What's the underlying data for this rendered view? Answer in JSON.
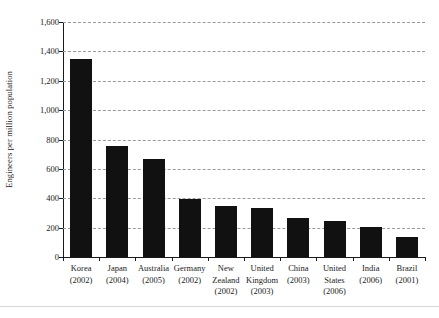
{
  "chart_data": {
    "type": "bar",
    "title": "",
    "xlabel": "",
    "ylabel": "Engineers per million population",
    "ylim": [
      0,
      1600
    ],
    "ytick_values": [
      1600,
      1400,
      1200,
      1000,
      800,
      600,
      400,
      200,
      0
    ],
    "ytick_labels": [
      "1,600",
      "1,400",
      "1,200",
      "1,000",
      "800",
      "600",
      "400",
      "200",
      "0"
    ],
    "grid": true,
    "grid_style": "dashed-horizontal",
    "legend": "none",
    "bar_color": "#111111",
    "categories": [
      "Korea (2002)",
      "Japan (2004)",
      "Australia (2005)",
      "Germany (2002)",
      "New Zealand (2002)",
      "United Kingdom (2003)",
      "China (2003)",
      "United States (2006)",
      "India (2006)",
      "Brazil (2001)"
    ],
    "category_names": [
      "Korea",
      "Japan",
      "Australia",
      "Germany",
      "New Zealand",
      "United Kingdom",
      "China",
      "United States",
      "India",
      "Brazil"
    ],
    "category_years": [
      "(2002)",
      "(2004)",
      "(2005)",
      "(2002)",
      "(2002)",
      "(2003)",
      "(2003)",
      "(2006)",
      "(2006)",
      "(2001)"
    ],
    "values": [
      1345,
      755,
      670,
      398,
      350,
      335,
      265,
      245,
      205,
      135
    ]
  }
}
